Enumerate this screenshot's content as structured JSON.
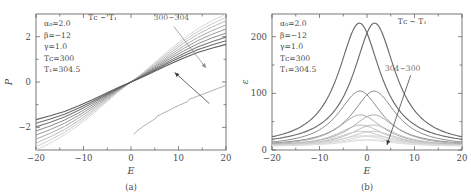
{
  "figure": {
    "background": "#ffffff",
    "axis_color": "#555555"
  },
  "panel_a": {
    "caption": "(a)",
    "xlabel": "E",
    "ylabel": "P",
    "params": [
      "α₀=2.0",
      "β=−12",
      "γ=1.0",
      "Tᴄ=300",
      "T₁=304.5"
    ],
    "temp_note": "Tᴄ ~ T₁",
    "series_annotation": "300~304"
  },
  "panel_b": {
    "caption": "(b)",
    "xlabel": "E",
    "ylabel": "ε",
    "params": [
      "α₀=2.0",
      "β=−12",
      "γ=1.0",
      "Tᴄ=300",
      "T₁=304.5"
    ],
    "temp_note": "Tᴄ ~ T₁",
    "series_annotation": "304~300"
  },
  "chart_data": [
    {
      "type": "line",
      "panel": "a",
      "title": "",
      "xlabel": "E",
      "ylabel": "P",
      "xlim": [
        -20,
        20
      ],
      "ylim": [
        -3.0,
        3.0
      ],
      "xticks": [
        -20,
        -10,
        0,
        10,
        20
      ],
      "xtick_labels": [
        "−20",
        "−10",
        "0",
        "10",
        "20"
      ],
      "yticks": [
        -2,
        0,
        2
      ],
      "ytick_labels": [
        "−2",
        "0",
        "2"
      ],
      "yticks_minor": [
        -1,
        1
      ],
      "grid": false,
      "legend": "none",
      "annotations": [
        {
          "text": "300~304",
          "x": 8.5,
          "y": 2.72,
          "color": "#9a9a9a"
        },
        {
          "text": "Tᴄ ~ T₁",
          "x": -6.0,
          "y": 2.72,
          "color": "#4a4a4a"
        }
      ],
      "arrows": [
        {
          "from": [
            9.0,
            2.45
          ],
          "to": [
            15.8,
            0.62
          ],
          "color": "#8c8c8c",
          "note": "points toward fanned P(E) curves"
        },
        {
          "from": [
            16.5,
            -0.95
          ],
          "to": [
            9.2,
            0.42
          ],
          "color": "#3a3a3a",
          "note": "points from lower noisy branch to main bundle"
        }
      ],
      "series": [
        {
          "name": "T=300",
          "color": "#d8d8d8",
          "width": 1.0,
          "comment": "steepest slope sigmoid, lightest gray",
          "x": [
            -20,
            -17,
            -14,
            -11,
            -8,
            -5,
            -3,
            -1.5,
            0,
            1.5,
            3,
            5,
            8,
            11,
            14,
            17,
            20
          ],
          "y": [
            -3.0,
            -2.7,
            -2.34,
            -1.9,
            -1.4,
            -0.86,
            -0.5,
            -0.24,
            0.0,
            0.24,
            0.5,
            0.86,
            1.4,
            1.9,
            2.34,
            2.7,
            3.0
          ]
        },
        {
          "name": "T=300.9",
          "color": "#cccccc",
          "width": 1.0,
          "x": [
            -20,
            -17,
            -14,
            -11,
            -8,
            -5,
            -3,
            -1.5,
            0,
            1.5,
            3,
            5,
            8,
            11,
            14,
            17,
            20
          ],
          "y": [
            -2.86,
            -2.56,
            -2.22,
            -1.8,
            -1.32,
            -0.81,
            -0.47,
            -0.23,
            0.0,
            0.23,
            0.47,
            0.81,
            1.32,
            1.8,
            2.22,
            2.56,
            2.86
          ]
        },
        {
          "name": "T=301.8",
          "color": "#bdbdbd",
          "width": 1.0,
          "x": [
            -20,
            -17,
            -14,
            -11,
            -8,
            -5,
            -3,
            -1.5,
            0,
            1.5,
            3,
            5,
            8,
            11,
            14,
            17,
            20
          ],
          "y": [
            -2.7,
            -2.42,
            -2.1,
            -1.7,
            -1.24,
            -0.76,
            -0.44,
            -0.215,
            0.0,
            0.215,
            0.44,
            0.76,
            1.24,
            1.7,
            2.1,
            2.42,
            2.7
          ]
        },
        {
          "name": "T=302.7",
          "color": "#ababab",
          "width": 1.0,
          "x": [
            -20,
            -17,
            -14,
            -11,
            -8,
            -5,
            -3,
            -1.5,
            0,
            1.5,
            3,
            5,
            8,
            11,
            14,
            17,
            20
          ],
          "y": [
            -2.52,
            -2.26,
            -1.96,
            -1.58,
            -1.16,
            -0.71,
            -0.41,
            -0.2,
            0.0,
            0.2,
            0.41,
            0.71,
            1.16,
            1.58,
            1.96,
            2.26,
            2.52
          ]
        },
        {
          "name": "T=303.0",
          "color": "#9a9a9a",
          "width": 1.0,
          "x": [
            -20,
            -17,
            -14,
            -11,
            -8,
            -5,
            -3,
            -1.5,
            0,
            1.5,
            3,
            5,
            8,
            11,
            14,
            17,
            20
          ],
          "y": [
            -2.34,
            -2.1,
            -1.82,
            -1.47,
            -1.08,
            -0.66,
            -0.385,
            -0.19,
            0.0,
            0.19,
            0.385,
            0.66,
            1.08,
            1.47,
            1.82,
            2.1,
            2.34
          ]
        },
        {
          "name": "T=303.4",
          "color": "#8a8a8a",
          "width": 1.0,
          "x": [
            -20,
            -17,
            -14,
            -11,
            -8,
            -5,
            -3,
            -1.5,
            0,
            1.5,
            3,
            5,
            8,
            11,
            14,
            17,
            20
          ],
          "y": [
            -2.16,
            -1.94,
            -1.68,
            -1.36,
            -1.0,
            -0.615,
            -0.36,
            -0.177,
            0.0,
            0.177,
            0.36,
            0.615,
            1.0,
            1.36,
            1.68,
            1.94,
            2.16
          ]
        },
        {
          "name": "T=303.8",
          "color": "#7a7a7a",
          "width": 1.05,
          "x": [
            -20,
            -17,
            -14,
            -11,
            -8,
            -5,
            -3,
            -1.5,
            0,
            1.5,
            3,
            5,
            8,
            11,
            14,
            17,
            20
          ],
          "y": [
            -1.98,
            -1.78,
            -1.545,
            -1.25,
            -0.92,
            -0.565,
            -0.33,
            -0.163,
            0.0,
            0.163,
            0.33,
            0.565,
            0.92,
            1.25,
            1.545,
            1.78,
            1.98
          ]
        },
        {
          "name": "T=304.0",
          "color": "#6b6b6b",
          "width": 1.1,
          "x": [
            -20,
            -17,
            -14,
            -11,
            -8,
            -5,
            -3,
            -1.5,
            0,
            1.5,
            3,
            5,
            8,
            11,
            14,
            17,
            20
          ],
          "y": [
            -1.82,
            -1.63,
            -1.42,
            -1.15,
            -0.845,
            -0.52,
            -0.305,
            -0.15,
            0.0,
            0.15,
            0.305,
            0.52,
            0.845,
            1.15,
            1.42,
            1.63,
            1.82
          ]
        },
        {
          "name": "T=304.5",
          "color": "#5e5e5e",
          "width": 1.15,
          "comment": "flattest slope, darkest gray",
          "x": [
            -20,
            -17,
            -14,
            -11,
            -8,
            -5,
            -3,
            -1.5,
            0,
            1.5,
            3,
            5,
            8,
            11,
            14,
            17,
            20
          ],
          "y": [
            -1.66,
            -1.49,
            -1.3,
            -1.05,
            -0.775,
            -0.475,
            -0.28,
            -0.138,
            0.0,
            0.138,
            0.28,
            0.475,
            0.775,
            1.05,
            1.3,
            1.49,
            1.66
          ]
        }
      ],
      "extra_series": [
        {
          "name": "noisy-lower-branch",
          "color": "#9a9a9a",
          "width": 0.8,
          "comment": "stepped/noisy branch in lower-right quadrant, from E~0.5 to E=20",
          "x": [
            0.6,
            1.5,
            2.5,
            3.5,
            4.5,
            5.2,
            5.4,
            6.2,
            7.2,
            8.2,
            9.2,
            10.2,
            11.2,
            12.0,
            12.3,
            13.2,
            14.2,
            15.2,
            16.2,
            17.2,
            18.2,
            19.1,
            20.0
          ],
          "y": [
            -2.3,
            -2.13,
            -1.97,
            -1.83,
            -1.7,
            -1.61,
            -1.52,
            -1.44,
            -1.33,
            -1.23,
            -1.12,
            -1.02,
            -0.93,
            -0.86,
            -0.76,
            -0.69,
            -0.61,
            -0.53,
            -0.45,
            -0.37,
            -0.29,
            -0.22,
            -0.14
          ]
        }
      ]
    },
    {
      "type": "line",
      "panel": "b",
      "title": "",
      "xlabel": "E",
      "ylabel": "ε",
      "xlim": [
        -20,
        20
      ],
      "ylim": [
        0,
        240
      ],
      "xticks": [
        -20,
        -10,
        0,
        10,
        20
      ],
      "xtick_labels": [
        "−20",
        "−10",
        "0",
        "10",
        "20"
      ],
      "yticks": [
        0,
        100,
        200
      ],
      "ytick_labels": [
        "0",
        "100",
        "200"
      ],
      "yticks_minor": [
        50,
        150
      ],
      "grid": false,
      "legend": "none",
      "annotations": [
        {
          "text": "304~300",
          "x": 7.5,
          "y": 140,
          "color": "#6e6e6e"
        },
        {
          "text": "Tᴄ ~ T₁",
          "x": 9.5,
          "y": 222,
          "color": "#4a4a4a"
        }
      ],
      "arrows": [
        {
          "from": [
            9.2,
            132
          ],
          "to": [
            4.2,
            9
          ],
          "color": "#3a3a3a",
          "note": "decreasing peak height with temperature"
        }
      ],
      "series": [
        {
          "name": "T=304.5-left",
          "color": "#6b6b6b",
          "width": 1.15,
          "peak_x": -1.6,
          "peak_y": 224,
          "width_param": 5.4,
          "baseline": 6
        },
        {
          "name": "T=304.5-right",
          "color": "#6b6b6b",
          "width": 1.15,
          "peak_x": 1.6,
          "peak_y": 224,
          "width_param": 5.4,
          "baseline": 6
        },
        {
          "name": "T=304.0-left",
          "color": "#8a8a8a",
          "width": 1.0,
          "peak_x": -1.5,
          "peak_y": 104,
          "width_param": 5.6,
          "baseline": 6
        },
        {
          "name": "T=304.0-right",
          "color": "#8a8a8a",
          "width": 1.0,
          "peak_x": 1.5,
          "peak_y": 104,
          "width_param": 5.6,
          "baseline": 6
        },
        {
          "name": "T=303.5-left",
          "color": "#ababab",
          "width": 1.0,
          "peak_x": -1.4,
          "peak_y": 62,
          "width_param": 5.8,
          "baseline": 6
        },
        {
          "name": "T=303.5-right",
          "color": "#ababab",
          "width": 1.0,
          "peak_x": 1.4,
          "peak_y": 62,
          "width_param": 5.8,
          "baseline": 6
        },
        {
          "name": "T=303.0-left",
          "color": "#bdbdbd",
          "width": 1.0,
          "peak_x": -1.3,
          "peak_y": 44,
          "width_param": 6.0,
          "baseline": 6
        },
        {
          "name": "T=303.0-right",
          "color": "#bdbdbd",
          "width": 1.0,
          "peak_x": 1.3,
          "peak_y": 44,
          "width_param": 6.0,
          "baseline": 6
        },
        {
          "name": "T=302.0-left",
          "color": "#c9c9c9",
          "width": 1.0,
          "peak_x": -1.2,
          "peak_y": 33,
          "width_param": 6.4,
          "baseline": 6
        },
        {
          "name": "T=302.0-right",
          "color": "#c9c9c9",
          "width": 1.0,
          "peak_x": 1.2,
          "peak_y": 33,
          "width_param": 6.4,
          "baseline": 6
        },
        {
          "name": "T=301.0-left",
          "color": "#d4d4d4",
          "width": 1.0,
          "peak_x": -1.0,
          "peak_y": 25,
          "width_param": 6.8,
          "baseline": 6
        },
        {
          "name": "T=301.0-right",
          "color": "#d4d4d4",
          "width": 1.0,
          "peak_x": 1.0,
          "peak_y": 25,
          "width_param": 6.8,
          "baseline": 6
        },
        {
          "name": "T=300.0-left",
          "color": "#dedede",
          "width": 1.0,
          "peak_x": -0.8,
          "peak_y": 18,
          "width_param": 7.2,
          "baseline": 6
        },
        {
          "name": "T=300.0-right",
          "color": "#dedede",
          "width": 1.0,
          "peak_x": 0.8,
          "peak_y": 18,
          "width_param": 7.2,
          "baseline": 6
        }
      ]
    }
  ]
}
